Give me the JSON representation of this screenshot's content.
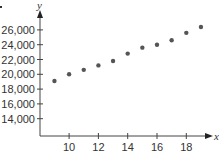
{
  "chart_data": {
    "type": "scatter",
    "title": "",
    "xlabel": "x",
    "ylabel": "y",
    "xlim": [
      8,
      19.8
    ],
    "ylim": [
      12500,
      28000
    ],
    "grid": false,
    "legend": null,
    "x_ticks": [
      10,
      12,
      14,
      16,
      18
    ],
    "x_tick_labels": [
      "10",
      "12",
      "14",
      "16",
      "18"
    ],
    "y_ticks": [
      14000,
      16000,
      18000,
      20000,
      22000,
      24000,
      26000
    ],
    "y_tick_labels": [
      "14,000",
      "16,000",
      "18,000",
      "20,000",
      "22,000",
      "24,000",
      "26,000"
    ],
    "series": [
      {
        "name": "data",
        "color": "#555555",
        "x": [
          9,
          10,
          11,
          12,
          13,
          14,
          15,
          16,
          17,
          18,
          19
        ],
        "y": [
          19100,
          20000,
          20600,
          21200,
          21800,
          22800,
          23600,
          24000,
          24600,
          25600,
          26400
        ]
      }
    ]
  },
  "axes": {
    "x_label": "x",
    "y_label": "y",
    "axis_color": "#444444"
  }
}
